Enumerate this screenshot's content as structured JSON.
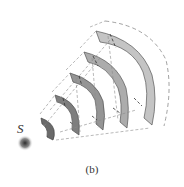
{
  "figure": {
    "caption": "(b)",
    "source_label": "S",
    "wavefronts": [
      {
        "index": 1,
        "fill": "#4a4a4a"
      },
      {
        "index": 2,
        "fill": "#6a6a6a"
      },
      {
        "index": 3,
        "fill": "#7e7e7e"
      },
      {
        "index": 4,
        "fill": "#959595"
      },
      {
        "index": 5,
        "fill": "#acacac"
      },
      {
        "index": 6,
        "fill": "#c4c4c4"
      }
    ],
    "colors": {
      "source_center": "#3a3a3a",
      "dashed_lines": "#8a8a8a",
      "band_stroke": "#555555"
    }
  }
}
